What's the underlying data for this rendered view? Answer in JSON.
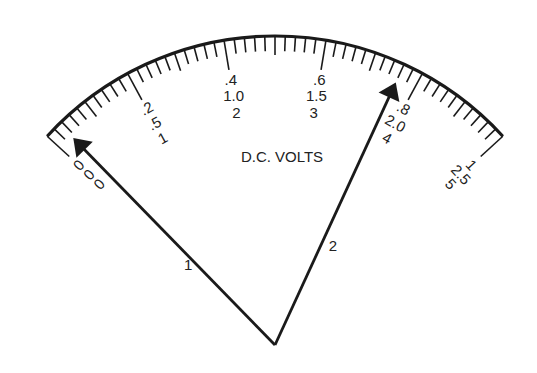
{
  "meter": {
    "title": "D.C. VOLTS",
    "colors": {
      "ink": "#1a1a1a",
      "background": "#ffffff"
    },
    "geometry": {
      "pivot": [
        275,
        345
      ],
      "radius": 309,
      "start_angle_deg": 137.5,
      "end_angle_deg": 42.5
    },
    "divisions": 50,
    "major_every": 10,
    "mid_every": 5,
    "scales": [
      {
        "name": "0-1 range",
        "labels": [
          "0",
          ".2",
          ".4",
          ".6",
          ".8",
          "1"
        ]
      },
      {
        "name": "0-2.5 range",
        "labels": [
          "0",
          ".5",
          "1.0",
          "1.5",
          "2.0",
          "2.5"
        ]
      },
      {
        "name": "0-5 range",
        "labels": [
          "0",
          "1",
          "2",
          "3",
          "4",
          "5"
        ]
      }
    ],
    "pointers": [
      {
        "label": "1",
        "value_fraction": 0.034
      },
      {
        "label": "2",
        "value_fraction": 0.76
      }
    ]
  }
}
